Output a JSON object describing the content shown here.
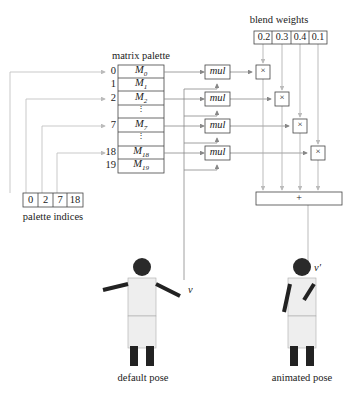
{
  "matrix_palette": {
    "label": "matrix palette",
    "rows": [
      {
        "index": "0",
        "matrix": "M",
        "sub": "0"
      },
      {
        "index": "1",
        "matrix": "M",
        "sub": "1"
      },
      {
        "index": "2",
        "matrix": "M",
        "sub": "2"
      },
      {
        "index": "",
        "matrix": "⋮",
        "sub": ""
      },
      {
        "index": "7",
        "matrix": "M",
        "sub": "7"
      },
      {
        "index": "",
        "matrix": "⋮",
        "sub": ""
      },
      {
        "index": "18",
        "matrix": "M",
        "sub": "18"
      },
      {
        "index": "19",
        "matrix": "M",
        "sub": "19"
      }
    ]
  },
  "palette_indices": {
    "label": "palette indices",
    "values": [
      "0",
      "2",
      "7",
      "18"
    ]
  },
  "blend_weights": {
    "label": "blend weights",
    "values": [
      "0.2",
      "0.3",
      "0.4",
      "0.1"
    ]
  },
  "mul_label": "mul",
  "times_symbol": "×",
  "plus_symbol": "+",
  "vertex_in": "v",
  "vertex_out": "v′",
  "default_pose_label": "default pose",
  "animated_pose_label": "animated pose",
  "colors": {
    "line": "#7a7a7a",
    "box": "#444444",
    "light_line": "#b0b0b0"
  }
}
